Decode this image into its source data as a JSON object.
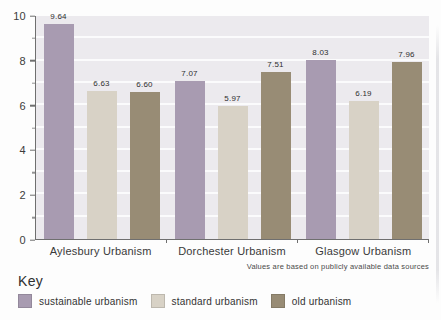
{
  "chart_data": {
    "type": "bar",
    "title": "",
    "categories": [
      "Aylesbury Urbanism",
      "Dorchester Urbanism",
      "Glasgow Urbanism"
    ],
    "series": [
      {
        "name": "sustainable urbanism",
        "color": "#a89bb1",
        "values": [
          9.64,
          7.07,
          8.03
        ]
      },
      {
        "name": "standard urbanism",
        "color": "#d8d2c6",
        "values": [
          6.63,
          5.97,
          6.19
        ]
      },
      {
        "name": "old urbanism",
        "color": "#988c75",
        "values": [
          6.6,
          7.51,
          7.96
        ]
      }
    ],
    "ylim": [
      0,
      10
    ],
    "yticks": [
      0,
      2,
      4,
      6,
      8,
      10
    ],
    "minor_yticks": [
      1,
      3,
      5,
      7,
      9
    ],
    "grid": "horizontal white lines at every unit",
    "legend_position": "bottom",
    "value_labels": true,
    "value_label_format": "2-decimals"
  },
  "note": "Values are based on publicly available data sources",
  "key": {
    "title": "Key"
  },
  "colors": {
    "plot_background": "#eceaee",
    "gridline": "#ffffff",
    "axis": "#6f6f6f",
    "text": "#333333",
    "page_background": "#fdfdfd"
  }
}
